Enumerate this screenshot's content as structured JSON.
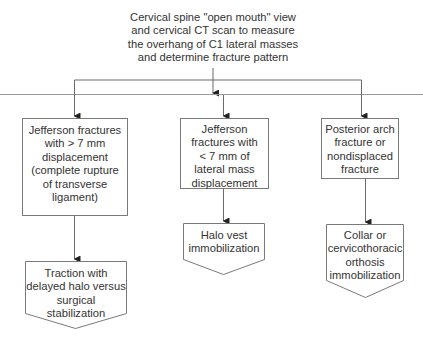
{
  "diagram": {
    "type": "flowchart",
    "colors": {
      "line": "#6a6a6a",
      "arrow": "#222222",
      "text": "#333333",
      "background": "#ffffff"
    },
    "root": {
      "id": "assessment",
      "text": "Cervical spine \"open mouth\" view\nand cervical CT scan to measure\nthe overhang of C1 lateral masses\nand determine fracture pattern"
    },
    "branches": [
      {
        "id": "jefferson-gt7",
        "condition": "Jefferson fractures\nwith > 7 mm\ndisplacement\n(complete rupture\nof transverse\nligament)",
        "treatment": "Traction with\ndelayed halo versus\nsurgical stabilization"
      },
      {
        "id": "jefferson-lt7",
        "condition": "Jefferson\nfractures with\n< 7 mm of\nlateral mass\ndisplacement",
        "treatment": "Halo vest\nimmobilization"
      },
      {
        "id": "posterior-arch",
        "condition": "Posterior arch\nfracture or\nnondisplaced\nfracture",
        "treatment": "Collar or\ncervicothoracic\northosis\nimmobilization"
      }
    ],
    "edges": [
      {
        "from": "assessment",
        "to": "jefferson-gt7"
      },
      {
        "from": "assessment",
        "to": "jefferson-lt7"
      },
      {
        "from": "assessment",
        "to": "posterior-arch"
      },
      {
        "from": "jefferson-gt7",
        "to": "jefferson-gt7-treatment"
      },
      {
        "from": "jefferson-lt7",
        "to": "jefferson-lt7-treatment"
      },
      {
        "from": "posterior-arch",
        "to": "posterior-arch-treatment"
      }
    ]
  }
}
